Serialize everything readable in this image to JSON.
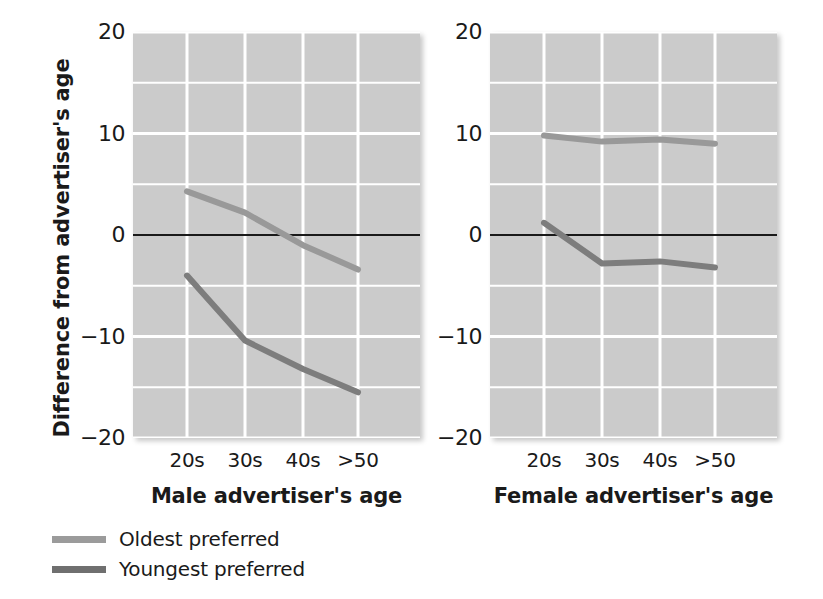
{
  "chart_data": {
    "type": "line",
    "title": "",
    "ylabel": "Difference from advertiser's age",
    "ylim": [
      -20,
      20
    ],
    "yticks": [
      20,
      10,
      0,
      -10,
      -20
    ],
    "ytick_labels": [
      "20",
      "10",
      "0",
      "−10",
      "−20"
    ],
    "grid": true,
    "grid_minor_step": 5,
    "zero_line": true,
    "legend_position": "below-left",
    "categories": [
      "20s",
      "30s",
      "40s",
      ">50"
    ],
    "panels": [
      {
        "xlabel": "Male advertiser's age",
        "series": [
          {
            "name": "Oldest preferred",
            "color": "#999999",
            "values": [
              4.3,
              2.2,
              -1.0,
              -3.4
            ]
          },
          {
            "name": "Youngest preferred",
            "color": "#7d7d7d",
            "values": [
              -4.0,
              -10.4,
              -13.2,
              -15.5
            ]
          }
        ]
      },
      {
        "xlabel": "Female advertiser's age",
        "series": [
          {
            "name": "Oldest preferred",
            "color": "#999999",
            "values": [
              9.8,
              9.2,
              9.4,
              9.0
            ]
          },
          {
            "name": "Youngest preferred",
            "color": "#7d7d7d",
            "values": [
              1.2,
              -2.8,
              -2.6,
              -3.2
            ]
          }
        ]
      }
    ]
  },
  "legend": {
    "items": [
      {
        "label": "Oldest preferred",
        "color": "#9b9b9b"
      },
      {
        "label": "Youngest preferred",
        "color": "#6f6f6f"
      }
    ]
  },
  "colors": {
    "plot_background": "#cbcbcb",
    "gridline": "#ffffff",
    "zero_line": "#1a1a1a",
    "text": "#1a1a1a"
  }
}
